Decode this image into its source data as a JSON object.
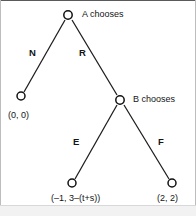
{
  "diagram": {
    "type": "game-tree",
    "title": "",
    "nodes": [
      {
        "id": "root",
        "label": "A chooses",
        "x": 68,
        "y": 15,
        "kind": "decision"
      },
      {
        "id": "leafN",
        "label": "(0, 0)",
        "x": 21,
        "y": 96,
        "kind": "terminal"
      },
      {
        "id": "nodeB",
        "label": "B chooses",
        "x": 120,
        "y": 100,
        "kind": "decision"
      },
      {
        "id": "leafE",
        "label": "(-1, 3-(t+s))",
        "x": 72,
        "y": 183,
        "kind": "terminal"
      },
      {
        "id": "leafF",
        "label": "(2, 2)",
        "x": 172,
        "y": 183,
        "kind": "terminal"
      }
    ],
    "edges": [
      {
        "from": "root",
        "to": "leafN",
        "label": "N"
      },
      {
        "from": "root",
        "to": "nodeB",
        "label": "R"
      },
      {
        "from": "nodeB",
        "to": "leafE",
        "label": "E"
      },
      {
        "from": "nodeB",
        "to": "leafF",
        "label": "F"
      }
    ],
    "labels": {
      "a_chooses": "A chooses",
      "b_chooses": "B chooses",
      "branch_n": "N",
      "branch_r": "R",
      "branch_e": "E",
      "branch_f": "F",
      "payoff_left": "(0, 0)",
      "payoff_mid": "(–1, 3–(t+s))",
      "payoff_right": "(2, 2)"
    },
    "colors": {
      "line": "#1c1c1c",
      "node_fill": "#ffffff",
      "node_stroke": "#111111",
      "text": "#141414",
      "background": "#ffffff",
      "border": "#bdbdbd",
      "footer_band": "#f2f2f2"
    }
  }
}
